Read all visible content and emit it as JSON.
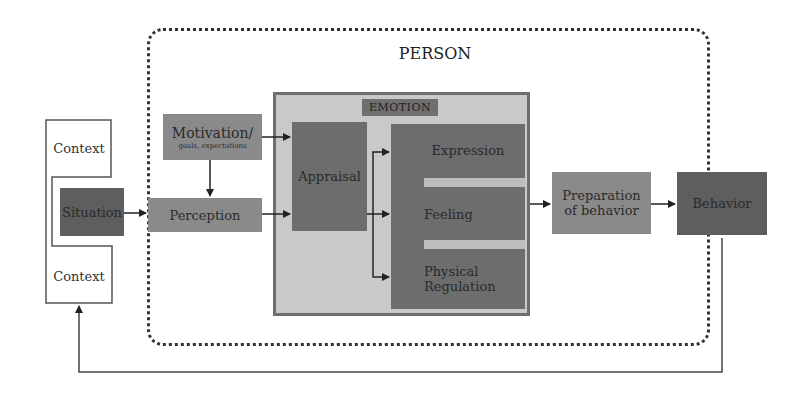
{
  "diagram": {
    "type": "flow-diagram",
    "title": "PERSON",
    "emotion_group_label": "EMOTION",
    "nodes": {
      "context_top": "Context",
      "situation": "Situation",
      "context_bottom": "Context",
      "motivation": "Motivation/",
      "motivation_sub": "goals, expectations",
      "perception": "Perception",
      "appraisal": "Appraisal",
      "expression": "Expression",
      "feeling": "Feeling",
      "physical_line1": "Physical",
      "physical_line2": "Regulation",
      "preparation_line1": "Preparation",
      "preparation_line2": "of behavior",
      "behavior": "Behavior"
    },
    "edges": [
      {
        "from": "Situation",
        "to": "Perception"
      },
      {
        "from": "Motivation/goals, expectations",
        "to": "Perception"
      },
      {
        "from": "Motivation/goals, expectations",
        "to": "Appraisal"
      },
      {
        "from": "Perception",
        "to": "Appraisal"
      },
      {
        "from": "Appraisal",
        "to": "Expression"
      },
      {
        "from": "Appraisal",
        "to": "Feeling"
      },
      {
        "from": "Appraisal",
        "to": "Physical Regulation"
      },
      {
        "from": "EMOTION",
        "to": "Preparation of behavior"
      },
      {
        "from": "Preparation of behavior",
        "to": "Behavior"
      },
      {
        "from": "Behavior",
        "to": "Context",
        "style": "feedback loop"
      }
    ],
    "colors": {
      "person_border": "#333333",
      "emotion_bg": "#c9c9c9",
      "emotion_border": "#6e6e6e",
      "node_mid": "#8a8a8a",
      "node_dark": "#6d6d6d",
      "behavior": "#5e5e5e"
    }
  }
}
